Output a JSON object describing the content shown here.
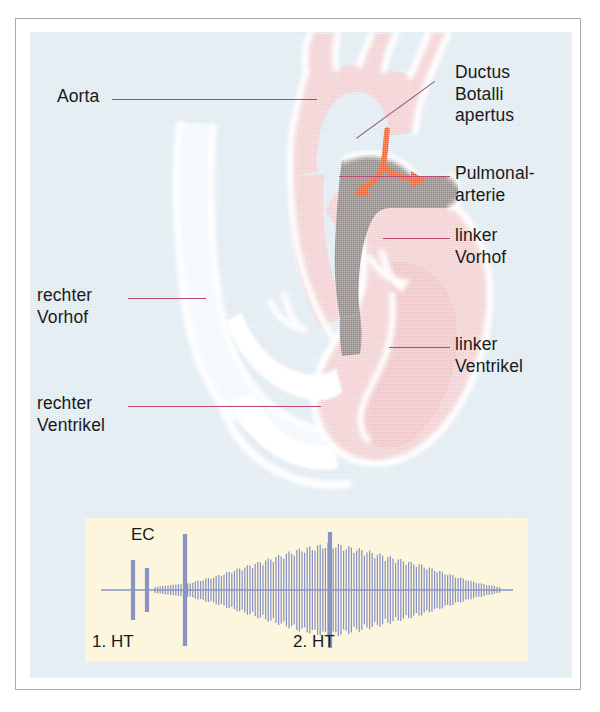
{
  "figure": {
    "kind": "medical-illustration",
    "background_color": "#dfe9f0",
    "frame_color": "#a8a8ac"
  },
  "anatomy_labels": {
    "aorta": "Aorta",
    "right_atrium": "rechter\nVorhof",
    "right_ventricle": "rechter\nVentrikel",
    "ductus": "Ductus\nBotalli\napertus",
    "pulmonary_artery": "Pulmonal-\narterie",
    "left_atrium": "linker\nVorhof",
    "left_ventricle": "linker\nVentrikel"
  },
  "colors": {
    "leader_line": "#b8486b",
    "ductus_leader": "#8d4f7a",
    "heart_pink": "#f3d3d4",
    "heart_pink_deep": "#eec3c5",
    "heart_white": "#ffffff",
    "shunt_gray": "#8e8784",
    "arrow_orange": "#f05a28",
    "phono_panel": "#fbf6dd",
    "phono_trace": "#8a93c4"
  },
  "phonocardiogram": {
    "panel_label": "Phonokardiogramm",
    "markers": {
      "first_heart_sound": "1. HT",
      "ejection_click": "EC",
      "second_heart_sound": "2. HT"
    },
    "chart_data": {
      "type": "line",
      "title": "Phonokardiogramm bei Ductus Botalli apertus",
      "xlabel": "",
      "ylabel": "",
      "annotations": [
        "1. HT",
        "EC",
        "2. HT"
      ],
      "description": "Kontinuierliches Maschinengeräusch mit Crescendo-Decrescendo um den 2. Herzton",
      "baseline_y": 72,
      "events": [
        {
          "name": "1. HT",
          "x": 48,
          "amplitude": 30,
          "type": "spike"
        },
        {
          "name": "1. HT second component",
          "x": 62,
          "amplitude": 22,
          "type": "spike"
        },
        {
          "name": "EC",
          "x": 100,
          "amplitude": 56,
          "type": "spike"
        },
        {
          "name": "2. HT",
          "x": 245,
          "amplitude": 58,
          "type": "spike"
        }
      ],
      "murmur_envelope": {
        "x": [
          100,
          130,
          160,
          190,
          215,
          245,
          275,
          305,
          335,
          365,
          390,
          415
        ],
        "amplitude": [
          6,
          14,
          24,
          34,
          42,
          48,
          42,
          34,
          26,
          16,
          8,
          3
        ]
      },
      "x_range": [
        20,
        432
      ],
      "y_range": [
        0,
        144
      ],
      "grid": false,
      "legend": "none"
    }
  }
}
